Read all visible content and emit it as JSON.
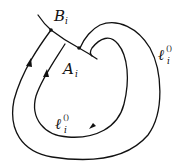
{
  "diagram": {
    "labels": {
      "B": {
        "main": "B",
        "sub": "i"
      },
      "A": {
        "main": "A",
        "sub": "i"
      },
      "outer_loop": {
        "main": "ℓ",
        "sub": "i",
        "sup": "()"
      },
      "inner_loop": {
        "main": "ℓ",
        "sub": "i",
        "sup": "()"
      }
    },
    "points": [
      {
        "name": "B_i",
        "x": 51,
        "y": 30
      },
      {
        "name": "A_i",
        "x": 79,
        "y": 48
      }
    ],
    "stroke_color": "#111111",
    "background": "#ffffff"
  }
}
